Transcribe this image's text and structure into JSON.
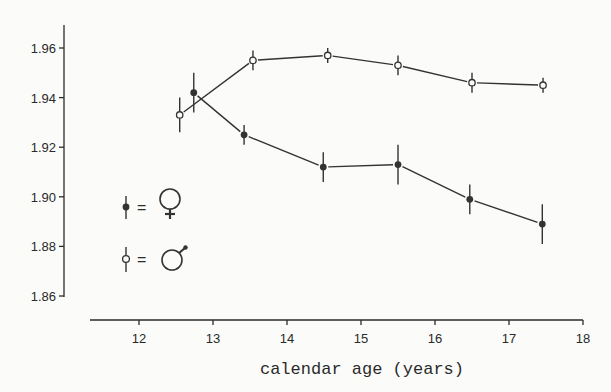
{
  "chart_data": {
    "type": "line",
    "title": "",
    "xlabel": "calendar age (years)",
    "ylabel": "",
    "xlim": [
      11.35,
      18
    ],
    "ylim": [
      1.86,
      1.968
    ],
    "x_ticks": [
      "12",
      "13",
      "14",
      "15",
      "16",
      "17",
      "18"
    ],
    "y_ticks": [
      "1.96",
      "1.94",
      "1.92",
      "1.90",
      "1.88",
      "1.86"
    ],
    "grid": false,
    "legend_position": "left-middle",
    "series": [
      {
        "name": "female (♀)",
        "marker": "filled-circle",
        "x": [
          12.74,
          13.42,
          14.49,
          15.5,
          16.47,
          17.45
        ],
        "values": [
          1.942,
          1.925,
          1.912,
          1.913,
          1.899,
          1.889
        ],
        "error": [
          0.008,
          0.004,
          0.006,
          0.008,
          0.006,
          0.008
        ]
      },
      {
        "name": "male (♂)",
        "marker": "open-circle",
        "x": [
          12.55,
          13.54,
          14.55,
          15.5,
          16.5,
          17.46
        ],
        "values": [
          1.933,
          1.955,
          1.957,
          1.953,
          1.946,
          1.945
        ],
        "error": [
          0.007,
          0.004,
          0.003,
          0.004,
          0.004,
          0.003
        ]
      }
    ]
  },
  "legend": {
    "female_symbol": "♀",
    "male_symbol": "♂",
    "equals": "="
  }
}
